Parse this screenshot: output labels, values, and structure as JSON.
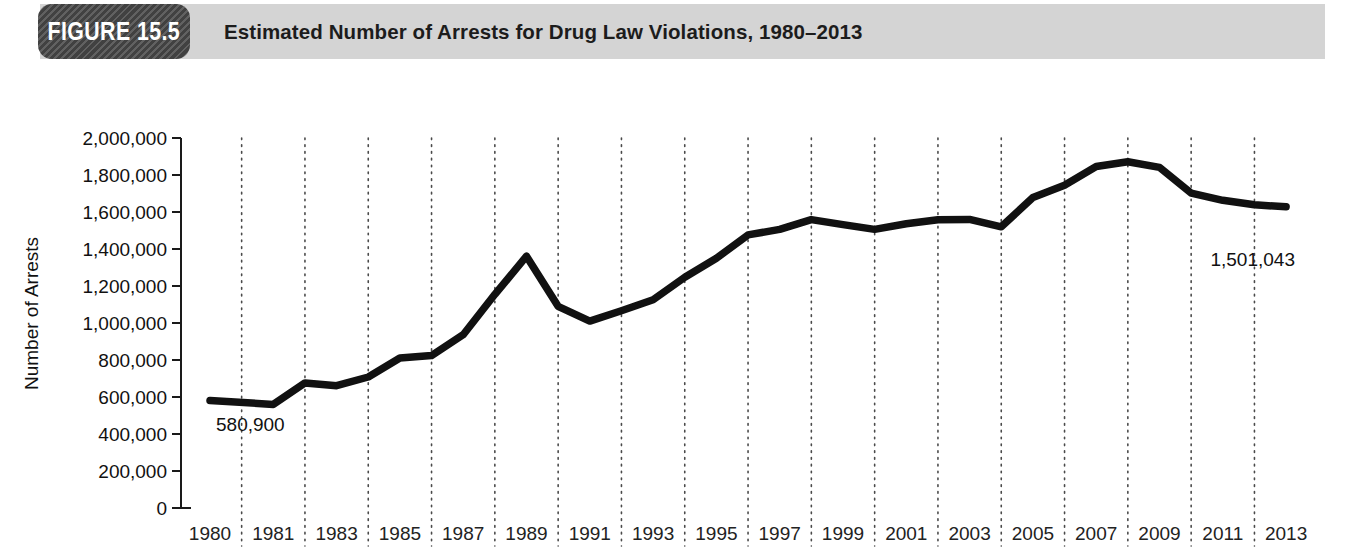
{
  "header": {
    "badge_label": "FIGURE 15.5",
    "title": "Estimated Number of Arrests for Drug Law Violations, 1980–2013",
    "bar_color": "#d4d4d4",
    "badge_color": "#4a4a4a"
  },
  "chart_data": {
    "type": "line",
    "title": "Estimated Number of Arrests for Drug Law Violations, 1980–2013",
    "xlabel": "",
    "ylabel": "Number of Arrests",
    "ylim": [
      0,
      2000000
    ],
    "ytick_values": [
      0,
      200000,
      400000,
      600000,
      800000,
      1000000,
      1200000,
      1400000,
      1600000,
      1800000,
      2000000
    ],
    "ytick_labels": [
      "0",
      "200,000",
      "400,000",
      "600,000",
      "800,000",
      "1,000,000",
      "1,200,000",
      "1,400,000",
      "1,600,000",
      "1,800,000",
      "2,000,000"
    ],
    "xtick_labels": [
      "1980",
      "1981",
      "1983",
      "1985",
      "1987",
      "1989",
      "1991",
      "1993",
      "1995",
      "1997",
      "1999",
      "2001",
      "2003",
      "2005",
      "2007",
      "2009",
      "2011",
      "2013"
    ],
    "grid": "vertical-dotted",
    "legend": null,
    "series": [
      {
        "name": "Estimated number of arrests",
        "color": "#111111",
        "x": [
          1980,
          1981,
          1982,
          1983,
          1984,
          1985,
          1986,
          1987,
          1988,
          1989,
          1990,
          1991,
          1992,
          1993,
          1994,
          1995,
          1996,
          1997,
          1998,
          1999,
          2000,
          2001,
          2002,
          2003,
          2004,
          2005,
          2006,
          2007,
          2008,
          2009,
          2010,
          2011,
          2012,
          2013
        ],
        "values": [
          580900,
          560000,
          676000,
          661000,
          708000,
          811000,
          824000,
          937000,
          1155000,
          1361000,
          1090000,
          1010000,
          1066000,
          1126000,
          1247000,
          1350000,
          1476000,
          1506000,
          1559000,
          1532000,
          1506000,
          1536000,
          1558000,
          1560000,
          1520000,
          1678000,
          1745000,
          1846000,
          1872000,
          1841000,
          1702000,
          1663000,
          1639000,
          1628000
        ]
      }
    ],
    "annotations": [
      {
        "name": "start-value",
        "label": "580,900",
        "year": 1980,
        "value": 580900
      },
      {
        "name": "end-value",
        "label": "1,501,043",
        "year": 2012,
        "value": 1501043
      }
    ]
  }
}
